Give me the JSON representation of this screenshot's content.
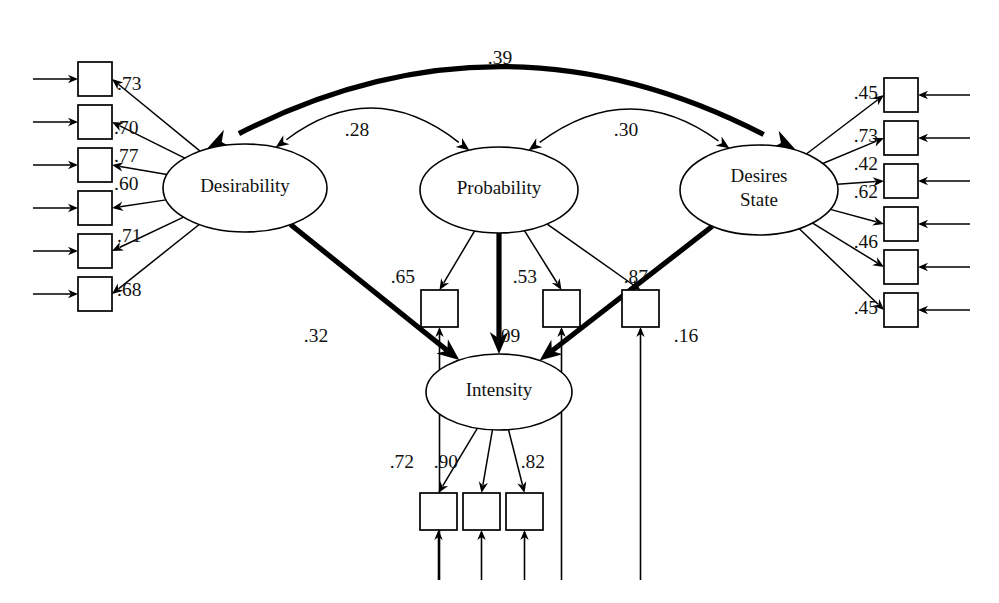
{
  "diagram": {
    "type": "structural-equation-model-path-diagram",
    "title": "",
    "background_color": "#ffffff",
    "line_color": "#000000",
    "width": 999,
    "height": 603
  },
  "latent_variables": [
    {
      "id": "desirability",
      "label": "Desirability",
      "label_lines": [
        "Desirability"
      ],
      "cx": 245,
      "cy": 188,
      "rx": 82,
      "ry": 44
    },
    {
      "id": "probability",
      "label": "Probability",
      "label_lines": [
        "Probability"
      ],
      "cx": 499,
      "cy": 190,
      "rx": 79,
      "ry": 43
    },
    {
      "id": "desires_state",
      "label": "Desires State",
      "label_lines": [
        "Desires",
        "State"
      ],
      "cx": 759,
      "cy": 190,
      "rx": 79,
      "ry": 45
    },
    {
      "id": "intensity",
      "label": "Intensity",
      "label_lines": [
        "Intensity"
      ],
      "cx": 499,
      "cy": 392,
      "rx": 73,
      "ry": 38
    }
  ],
  "covariances": [
    {
      "id": "cov-desirability-desires",
      "from": "desirability",
      "to": "desires_state",
      "value": ".39",
      "style": "bold",
      "double_headed": true,
      "label_x": 500,
      "label_y": 60
    },
    {
      "id": "cov-desirability-probability",
      "from": "desirability",
      "to": "probability",
      "value": ".28",
      "style": "thin",
      "double_headed": true,
      "label_x": 357,
      "label_y": 132
    },
    {
      "id": "cov-probability-desires",
      "from": "probability",
      "to": "desires_state",
      "value": ".30",
      "style": "thin",
      "double_headed": true,
      "label_x": 626,
      "label_y": 132
    }
  ],
  "structural_paths": [
    {
      "id": "path-desirability-intensity",
      "from": "desirability",
      "to": "intensity",
      "value": ".32",
      "style": "bold",
      "label_x": 316,
      "label_y": 338
    },
    {
      "id": "path-probability-intensity",
      "from": "probability",
      "to": "intensity",
      "value": ".09",
      "style": "bold",
      "label_x": 508,
      "label_y": 338
    },
    {
      "id": "path-desires-intensity",
      "from": "desires_state",
      "to": "intensity",
      "value": ".16",
      "style": "bold",
      "label_x": 686,
      "label_y": 338
    }
  ],
  "indicator_groups": [
    {
      "id": "desirability-indicators",
      "latent": "desirability",
      "side": "left",
      "box_size": 34,
      "box_x": 78,
      "label_side": "right",
      "indicators": [
        {
          "id": "d1",
          "value": ".73",
          "box_y": 62,
          "label_x": 117,
          "label_y": 86
        },
        {
          "id": "d2",
          "value": ".70",
          "box_y": 105,
          "label_x": 114,
          "label_y": 130
        },
        {
          "id": "d3",
          "value": ".77",
          "box_y": 148,
          "label_x": 114,
          "label_y": 158
        },
        {
          "id": "d4",
          "value": ".60",
          "box_y": 191,
          "label_x": 114,
          "label_y": 186
        },
        {
          "id": "d5",
          "value": ".71",
          "box_y": 234,
          "label_x": 117,
          "label_y": 238
        },
        {
          "id": "d6",
          "value": ".68",
          "box_y": 277,
          "label_x": 117,
          "label_y": 292
        }
      ]
    },
    {
      "id": "probability-indicators",
      "latent": "probability",
      "side": "bottom",
      "box_size": 37,
      "box_y": 290,
      "label_side": "left",
      "indicators": [
        {
          "id": "p1",
          "value": ".65",
          "box_x": 421,
          "label_x": 415,
          "label_y": 279
        },
        {
          "id": "p2",
          "value": ".53",
          "box_x": 543,
          "label_x": 537,
          "label_y": 279
        },
        {
          "id": "p3",
          "value": ".87",
          "box_x": 622,
          "label_x": 648,
          "label_y": 279
        }
      ]
    },
    {
      "id": "desires-indicators",
      "latent": "desires_state",
      "side": "right",
      "box_size": 34,
      "box_x": 884,
      "label_side": "left",
      "indicators": [
        {
          "id": "s1",
          "value": ".45",
          "box_y": 78,
          "label_x": 878,
          "label_y": 95
        },
        {
          "id": "s2",
          "value": ".73",
          "box_y": 121,
          "label_x": 878,
          "label_y": 138
        },
        {
          "id": "s3",
          "value": ".42",
          "box_y": 164,
          "label_x": 878,
          "label_y": 166
        },
        {
          "id": "s4",
          "value": ".62",
          "box_y": 207,
          "label_x": 878,
          "label_y": 194
        },
        {
          "id": "s5",
          "value": ".46",
          "box_y": 250,
          "label_x": 878,
          "label_y": 244
        },
        {
          "id": "s6",
          "value": ".45",
          "box_y": 293,
          "label_x": 878,
          "label_y": 310
        }
      ]
    },
    {
      "id": "intensity-indicators",
      "latent": "intensity",
      "side": "bottom",
      "box_size": 37,
      "box_y": 493,
      "label_side": "left",
      "indicators": [
        {
          "id": "i1",
          "value": ".72",
          "box_x": 420,
          "label_x": 414,
          "label_y": 464
        },
        {
          "id": "i2",
          "value": ".90",
          "box_x": 463,
          "label_x": 458,
          "label_y": 464
        },
        {
          "id": "i3",
          "value": ".82",
          "box_x": 506,
          "label_x": 545,
          "label_y": 464
        }
      ]
    }
  ]
}
